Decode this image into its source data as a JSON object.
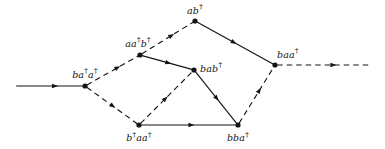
{
  "figure": {
    "type": "directed-graph",
    "width": 385,
    "height": 149,
    "background_color": "#ffffff",
    "ink_color": "#141414"
  },
  "nodes": [
    {
      "id": "ba_dag_a_dag",
      "label": "ba†a†",
      "label_html": "ba<span class=\"dag\">†</span>a<span class=\"dag\">†</span>",
      "x": 85,
      "y": 86,
      "label_x": 85,
      "label_y": 79,
      "label_anchor": "anchor-center"
    },
    {
      "id": "aa_dag_b_dag",
      "label": "aa†b†",
      "label_html": "aa<span class=\"dag\">†</span>b<span class=\"dag\">†</span>",
      "x": 140,
      "y": 55,
      "label_x": 138,
      "label_y": 48,
      "label_anchor": "anchor-center"
    },
    {
      "id": "ab_dag",
      "label": "ab†",
      "label_html": "ab<span class=\"dag\">†</span>",
      "x": 195,
      "y": 21,
      "label_x": 195,
      "label_y": 15,
      "label_anchor": "anchor-center"
    },
    {
      "id": "bab_dag",
      "label": "bab†",
      "label_html": "bab<span class=\"dag\">†</span>",
      "x": 194,
      "y": 70,
      "label_x": 200,
      "label_y": 73,
      "label_anchor": "anchor-left"
    },
    {
      "id": "baa_dag",
      "label": "baa†",
      "label_html": "baa<span class=\"dag\">†</span>",
      "x": 275,
      "y": 65,
      "label_x": 277,
      "label_y": 59,
      "label_anchor": "anchor-left"
    },
    {
      "id": "b_dag_aa_dag",
      "label": "b†aa†",
      "label_html": "b<span class=\"dag\">†</span>aa<span class=\"dag\">†</span>",
      "x": 139,
      "y": 125,
      "label_x": 139,
      "label_y": 131,
      "label_anchor": "anchor-center-below"
    },
    {
      "id": "bba_dag",
      "label": "bba†",
      "label_html": "bba<span class=\"dag\">†</span>",
      "x": 238,
      "y": 125,
      "label_x": 238,
      "label_y": 131,
      "label_anchor": "anchor-center-below"
    }
  ],
  "edges": [
    {
      "id": "edge-in",
      "from": "entry-point",
      "to": "ba_dag_a_dag",
      "style": "solid",
      "x1": 14,
      "y1": 86,
      "x2": 85,
      "y2": 86,
      "arrow_t": 0.62
    },
    {
      "id": "edge-ba_dag_a_dag-to-aa_dag_b_dag",
      "from": "ba_dag_a_dag",
      "to": "aa_dag_b_dag",
      "style": "dashed",
      "x1": 85,
      "y1": 86,
      "x2": 140,
      "y2": 55,
      "arrow_t": 0.64
    },
    {
      "id": "edge-ba_dag_a_dag-to-b_dag_aa_dag",
      "from": "ba_dag_a_dag",
      "to": "b_dag_aa_dag",
      "style": "dashed",
      "x1": 85,
      "y1": 86,
      "x2": 139,
      "y2": 125,
      "arrow_t": 0.56
    },
    {
      "id": "edge-aa_dag_b_dag-to-ab_dag",
      "from": "aa_dag_b_dag",
      "to": "ab_dag",
      "style": "dashed",
      "x1": 140,
      "y1": 55,
      "x2": 195,
      "y2": 21,
      "arrow_t": 0.62
    },
    {
      "id": "edge-aa_dag_b_dag-to-bab_dag",
      "from": "aa_dag_b_dag",
      "to": "bab_dag",
      "style": "solid",
      "x1": 140,
      "y1": 55,
      "x2": 194,
      "y2": 70,
      "arrow_t": 0.58
    },
    {
      "id": "edge-ab_dag-to-baa_dag",
      "from": "ab_dag",
      "to": "baa_dag",
      "style": "solid",
      "x1": 195,
      "y1": 21,
      "x2": 275,
      "y2": 65,
      "arrow_t": 0.52
    },
    {
      "id": "edge-b_dag_aa_dag-to-bab_dag",
      "from": "b_dag_aa_dag",
      "to": "bab_dag",
      "style": "dashed",
      "x1": 139,
      "y1": 125,
      "x2": 194,
      "y2": 70,
      "arrow_t": 0.52
    },
    {
      "id": "edge-b_dag_aa_dag-to-bba_dag",
      "from": "b_dag_aa_dag",
      "to": "bba_dag",
      "style": "solid",
      "x1": 139,
      "y1": 125,
      "x2": 238,
      "y2": 125,
      "arrow_t": 0.56
    },
    {
      "id": "edge-bab_dag-to-bba_dag",
      "from": "bab_dag",
      "to": "bba_dag",
      "style": "solid",
      "x1": 194,
      "y1": 70,
      "x2": 238,
      "y2": 125,
      "arrow_t": 0.56
    },
    {
      "id": "edge-bba_dag-to-baa_dag",
      "from": "bba_dag",
      "to": "baa_dag",
      "style": "dashed",
      "x1": 238,
      "y1": 125,
      "x2": 275,
      "y2": 65,
      "arrow_t": 0.62
    },
    {
      "id": "edge-out",
      "from": "baa_dag",
      "to": "exit-point",
      "style": "dashed",
      "x1": 275,
      "y1": 65,
      "x2": 374,
      "y2": 65,
      "arrow_t": 0.62
    }
  ]
}
